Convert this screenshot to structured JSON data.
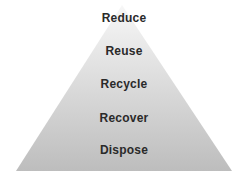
{
  "diagram": {
    "type": "pyramid",
    "title": "",
    "tiers": [
      {
        "label": "Reduce"
      },
      {
        "label": "Reuse"
      },
      {
        "label": "Recycle"
      },
      {
        "label": "Recover"
      },
      {
        "label": "Dispose"
      }
    ],
    "colors": {
      "top": "#f7f7f7",
      "bottom": "#bdbdbd",
      "text": "#2a2a2a"
    }
  }
}
